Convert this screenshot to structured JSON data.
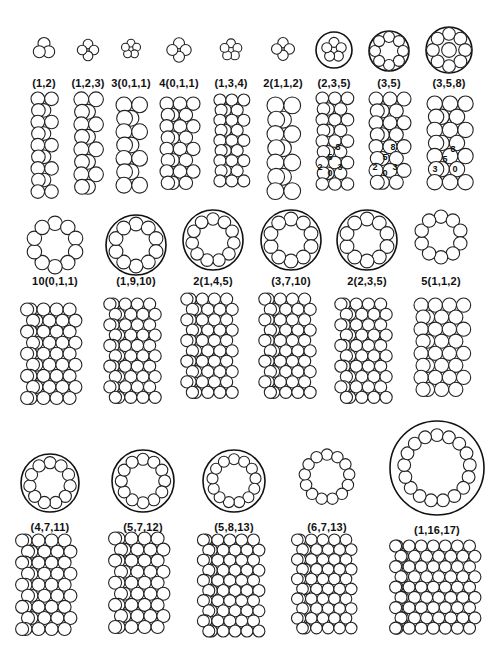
{
  "figure": {
    "rows": [
      {
        "structures": [
          {
            "label": "(1,2)",
            "cx": 44,
            "cy": 49,
            "r": 13,
            "n": 3,
            "shell": false,
            "cols": 2,
            "colW": 26,
            "colH": 105,
            "colY": 92
          },
          {
            "label": "(1,2,3)",
            "cx": 88,
            "cy": 50,
            "r": 14,
            "n": 4,
            "shell": false,
            "cols": 2,
            "colW": 28,
            "colH": 105,
            "colY": 92
          },
          {
            "label": "3(0,1,1)",
            "cx": 131,
            "cy": 49,
            "r": 14,
            "n": 5,
            "shell": false,
            "cols": 2,
            "colW": 30,
            "colH": 100,
            "colY": 97
          },
          {
            "label": "4(0,1,1)",
            "cx": 179,
            "cy": 50,
            "r": 16,
            "n": 4,
            "shell": false,
            "cols": 3,
            "colW": 38,
            "colH": 100,
            "colY": 97
          },
          {
            "label": "(1,3,4)",
            "cx": 231,
            "cy": 50,
            "r": 16,
            "n": 5,
            "shell": false,
            "cols": 3,
            "colW": 34,
            "colH": 100,
            "colY": 94
          },
          {
            "label": "2(1,1,2)",
            "cx": 283,
            "cy": 49,
            "r": 15,
            "n": 4,
            "shell": false,
            "cols": 2,
            "colW": 32,
            "colH": 100,
            "colY": 97
          },
          {
            "label": "(2,3,5)",
            "cx": 334,
            "cy": 50,
            "r": 18,
            "n": 5,
            "shell": true,
            "cols": 3,
            "colW": 36,
            "colH": 100,
            "colY": 92,
            "indices": [
              "8",
              "5",
              "2",
              "3",
              "0"
            ]
          },
          {
            "label": "(3,5)",
            "cx": 389,
            "cy": 51,
            "r": 20,
            "n": 8,
            "shell": true,
            "cols": 3,
            "colW": 40,
            "colH": 100,
            "colY": 92,
            "indices": [
              "8",
              "5",
              "2",
              "3",
              "0"
            ]
          },
          {
            "label": "(3,5,8)",
            "cx": 449,
            "cy": 50,
            "r": 23,
            "n": 8,
            "shell": true,
            "cols": 3,
            "colW": 44,
            "colH": 98,
            "colY": 96,
            "indices": [
              "8",
              "5",
              "3",
              "0"
            ]
          }
        ],
        "labelY": 77
      },
      {
        "structures": [
          {
            "label": "10(0,1,1)",
            "cx": 55,
            "cy": 245,
            "r": 31,
            "n": 10,
            "shell": false,
            "cols": 5,
            "colW": 62,
            "colH": 105,
            "colY": 303
          },
          {
            "label": "(1,9,10)",
            "cx": 136,
            "cy": 245,
            "r": 30,
            "n": 10,
            "shell": true,
            "cols": 5,
            "colW": 58,
            "colH": 105,
            "colY": 298
          },
          {
            "label": "2(1,4,5)",
            "cx": 213,
            "cy": 240,
            "r": 30,
            "n": 11,
            "shell": true,
            "cols": 5,
            "colW": 58,
            "colH": 110,
            "colY": 293
          },
          {
            "label": "(3,7,10)",
            "cx": 291,
            "cy": 240,
            "r": 30,
            "n": 10,
            "shell": true,
            "cols": 5,
            "colW": 58,
            "colH": 110,
            "colY": 293
          },
          {
            "label": "2(2,3,5)",
            "cx": 367,
            "cy": 240,
            "r": 30,
            "n": 10,
            "shell": true,
            "cols": 5,
            "colW": 58,
            "colH": 105,
            "colY": 298
          },
          {
            "label": "5(1,1,2)",
            "cx": 441,
            "cy": 237,
            "r": 29,
            "n": 10,
            "shell": false,
            "cols": 4,
            "colW": 54,
            "colH": 105,
            "colY": 298
          }
        ],
        "labelY": 275
      },
      {
        "structures": [
          {
            "label": "(4,7,11)",
            "cx": 50,
            "cy": 483,
            "r": 29,
            "n": 11,
            "shell": true,
            "cols": 5,
            "colW": 62,
            "colH": 105,
            "colY": 534
          },
          {
            "label": "(5,7,12)",
            "cx": 143,
            "cy": 481,
            "r": 31,
            "n": 12,
            "shell": true,
            "cols": 5,
            "colW": 62,
            "colH": 105,
            "colY": 532
          },
          {
            "label": "(5,8,13)",
            "cx": 234,
            "cy": 481,
            "r": 31,
            "n": 13,
            "shell": true,
            "cols": 6,
            "colW": 68,
            "colH": 105,
            "colY": 534
          },
          {
            "label": "(6,7,13)",
            "cx": 327,
            "cy": 477,
            "r": 32,
            "n": 13,
            "shell": false,
            "cols": 6,
            "colW": 66,
            "colH": 105,
            "colY": 534
          },
          {
            "label": "(1,16,17)",
            "cx": 437,
            "cy": 468,
            "r": 47,
            "n": 17,
            "shell": true,
            "cols": 8,
            "colW": 92,
            "colH": 95,
            "colY": 540
          }
        ],
        "labelY": 521
      }
    ]
  }
}
